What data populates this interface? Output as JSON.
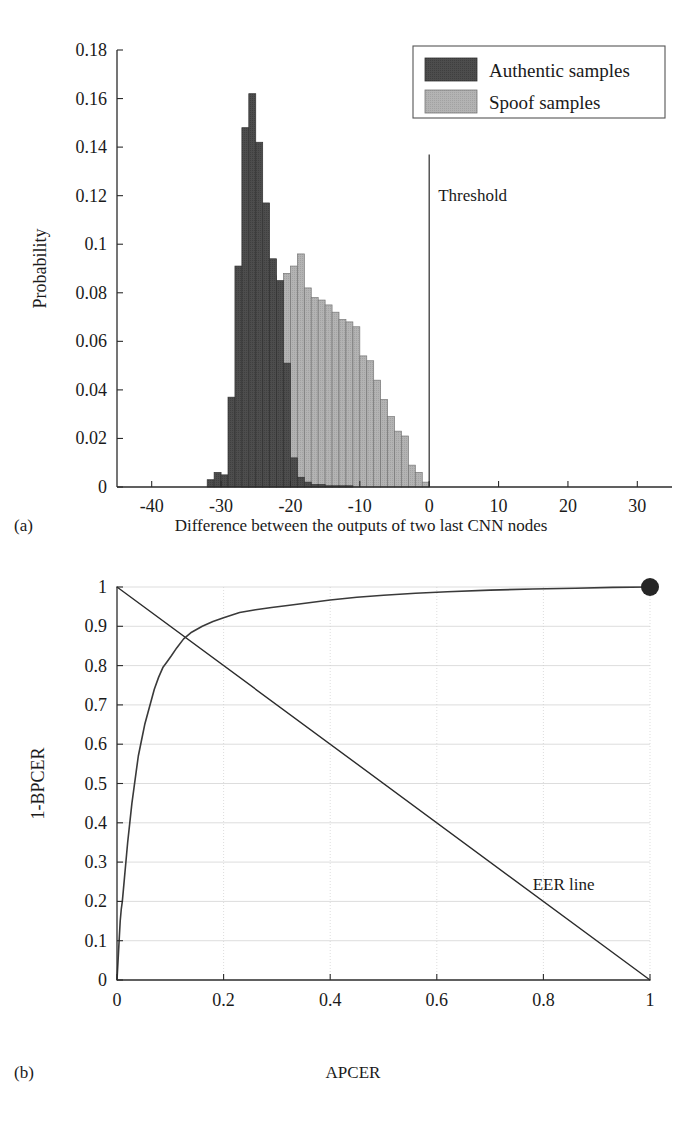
{
  "figure": {
    "panel_a_label": "(a)",
    "panel_b_label": "(b)",
    "panel_a_caption": "Difference between the outputs of two last CNN nodes",
    "panel_b_caption": "APCER"
  },
  "colors": {
    "authentic": "#4d4d4d",
    "spoof": "#b3b3b3",
    "axis": "#2b2b2b",
    "grid": "#cfcfcf",
    "curve": "#3a3a3a",
    "marker": "#262626",
    "background": "#ffffff"
  },
  "chart_data": [
    {
      "type": "bar",
      "id": "histogram-authentic-spoof",
      "title": "",
      "xlabel": "Difference between the outputs of two last CNN nodes",
      "ylabel": "Probability",
      "xlim": [
        -45,
        35
      ],
      "ylim": [
        0,
        0.18
      ],
      "xticks": [
        -40,
        -30,
        -20,
        -10,
        0,
        10,
        20,
        30
      ],
      "xtick_labels": [
        "-40",
        "-30",
        "-20",
        "-10",
        "0",
        "10",
        "20",
        "30"
      ],
      "yticks": [
        0,
        0.02,
        0.04,
        0.06,
        0.08,
        0.1,
        0.12,
        0.14,
        0.16,
        0.18
      ],
      "ytick_labels": [
        "0",
        "0.02",
        "0.04",
        "0.06",
        "0.08",
        "0.1",
        "0.12",
        "0.14",
        "0.16",
        "0.18"
      ],
      "grid": false,
      "bin_width": 1,
      "legend": {
        "position": "top-right",
        "entries": [
          {
            "name": "Authentic samples",
            "color": "#4d4d4d"
          },
          {
            "name": "Spoof samples",
            "color": "#b3b3b3"
          }
        ]
      },
      "annotations": [
        {
          "text": "Threshold",
          "x": 0,
          "y": 0.118,
          "type": "vline-label"
        }
      ],
      "vline": {
        "x": 0,
        "y_top": 0.137
      },
      "series": [
        {
          "name": "Authentic samples",
          "color": "#4d4d4d",
          "bins": [
            -32,
            -31,
            -30,
            -29,
            -28,
            -27,
            -26,
            -25,
            -24,
            -23,
            -22,
            -21,
            -20,
            -19,
            -18,
            -17,
            -16,
            -15,
            -14,
            -13,
            -12
          ],
          "values": [
            0.003,
            0.006,
            0.005,
            0.037,
            0.091,
            0.148,
            0.162,
            0.142,
            0.117,
            0.094,
            0.085,
            0.051,
            0.012,
            0.004,
            0.002,
            0.001,
            0.001,
            0.0005,
            0.0005,
            0.0005,
            0.0005
          ]
        },
        {
          "name": "Spoof samples",
          "color": "#b3b3b3",
          "bins": [
            -27,
            -26,
            -25,
            -24,
            -23,
            -22,
            -21,
            -20,
            -19,
            -18,
            -17,
            -16,
            -15,
            -14,
            -13,
            -12,
            -11,
            -10,
            -9,
            -8,
            -7,
            -6,
            -5,
            -4,
            -3,
            -2,
            -1
          ],
          "values": [
            0.002,
            0.004,
            0.008,
            0.085,
            0.087,
            0.084,
            0.088,
            0.091,
            0.096,
            0.082,
            0.078,
            0.077,
            0.075,
            0.072,
            0.069,
            0.068,
            0.066,
            0.054,
            0.052,
            0.044,
            0.036,
            0.029,
            0.023,
            0.021,
            0.009,
            0.006,
            0.002
          ]
        }
      ]
    },
    {
      "type": "line",
      "id": "roc-curve",
      "title": "",
      "xlabel": "APCER",
      "ylabel": "1-BPCER",
      "xlim": [
        0,
        1
      ],
      "ylim": [
        0,
        1
      ],
      "xticks": [
        0,
        0.2,
        0.4,
        0.6,
        0.8,
        1
      ],
      "xtick_labels": [
        "0",
        "0.2",
        "0.4",
        "0.6",
        "0.8",
        "1"
      ],
      "yticks": [
        0,
        0.1,
        0.2,
        0.3,
        0.4,
        0.5,
        0.6,
        0.7,
        0.8,
        0.9,
        1
      ],
      "ytick_labels": [
        "0",
        "0.1",
        "0.2",
        "0.3",
        "0.4",
        "0.5",
        "0.6",
        "0.7",
        "0.8",
        "0.9",
        "1"
      ],
      "grid": true,
      "annotations": [
        {
          "text": "EER line",
          "x": 0.78,
          "y": 0.23,
          "type": "text"
        }
      ],
      "series": [
        {
          "name": "ROC",
          "color": "#3a3a3a",
          "x": [
            0,
            0.002,
            0.004,
            0.006,
            0.008,
            0.01,
            0.012,
            0.014,
            0.016,
            0.018,
            0.02,
            0.024,
            0.028,
            0.032,
            0.036,
            0.04,
            0.046,
            0.052,
            0.058,
            0.064,
            0.07,
            0.078,
            0.086,
            0.094,
            0.102,
            0.112,
            0.125,
            0.14,
            0.16,
            0.18,
            0.2,
            0.23,
            0.26,
            0.29,
            0.32,
            0.36,
            0.4,
            0.45,
            0.5,
            0.56,
            0.62,
            0.7,
            0.78,
            0.86,
            0.93,
            1.0
          ],
          "y": [
            0,
            0.05,
            0.1,
            0.15,
            0.18,
            0.2,
            0.23,
            0.26,
            0.29,
            0.32,
            0.35,
            0.4,
            0.45,
            0.49,
            0.53,
            0.57,
            0.61,
            0.65,
            0.68,
            0.71,
            0.74,
            0.77,
            0.795,
            0.81,
            0.825,
            0.845,
            0.868,
            0.885,
            0.9,
            0.912,
            0.922,
            0.935,
            0.942,
            0.948,
            0.953,
            0.96,
            0.967,
            0.974,
            0.979,
            0.984,
            0.988,
            0.992,
            0.995,
            0.997,
            0.999,
            1.0
          ]
        },
        {
          "name": "EER line",
          "color": "#2b2b2b",
          "x": [
            0,
            1
          ],
          "y": [
            1,
            0
          ]
        }
      ],
      "marker": {
        "x": 1,
        "y": 1,
        "color": "#262626",
        "size": 9
      }
    }
  ]
}
